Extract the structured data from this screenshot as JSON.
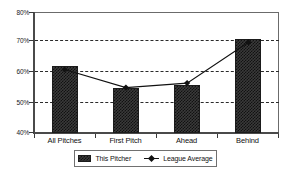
{
  "chart_data": {
    "type": "bar",
    "title": "",
    "subtitle": "",
    "xlabel": "",
    "ylabel": "",
    "categories": [
      "All Pitches",
      "First Pitch",
      "Ahead",
      "Behind"
    ],
    "ylim": [
      40,
      80
    ],
    "ytick_labels": [
      "80%",
      "70%",
      "60%",
      "50%",
      "40%"
    ],
    "ytick_values": [
      80,
      70,
      60,
      50,
      40
    ],
    "grid": true,
    "gridlines_at": [
      70,
      60,
      50
    ],
    "legend_position": "bottom-center",
    "series": [
      {
        "name": "This Pitcher",
        "type": "bar",
        "values": [
          62,
          55,
          56,
          71
        ],
        "color": "#333333"
      },
      {
        "name": "League Average",
        "type": "line",
        "values": [
          61,
          55,
          56.5,
          70
        ],
        "color": "#111111",
        "marker": "diamond"
      }
    ]
  },
  "axis": {
    "y_ticks": [
      {
        "label": "80%",
        "value": 80
      },
      {
        "label": "70%",
        "value": 70
      },
      {
        "label": "60%",
        "value": 60
      },
      {
        "label": "50%",
        "value": 50
      },
      {
        "label": "40%",
        "value": 40
      }
    ],
    "x_ticks": [
      {
        "label": "All Pitches"
      },
      {
        "label": "First Pitch"
      },
      {
        "label": "Ahead"
      },
      {
        "label": "Behind"
      }
    ]
  },
  "legend": {
    "items": [
      {
        "label": "This Pitcher",
        "marker": "swatch-pattern-icon"
      },
      {
        "label": "League Average",
        "marker": "line-diamond-icon"
      }
    ]
  }
}
